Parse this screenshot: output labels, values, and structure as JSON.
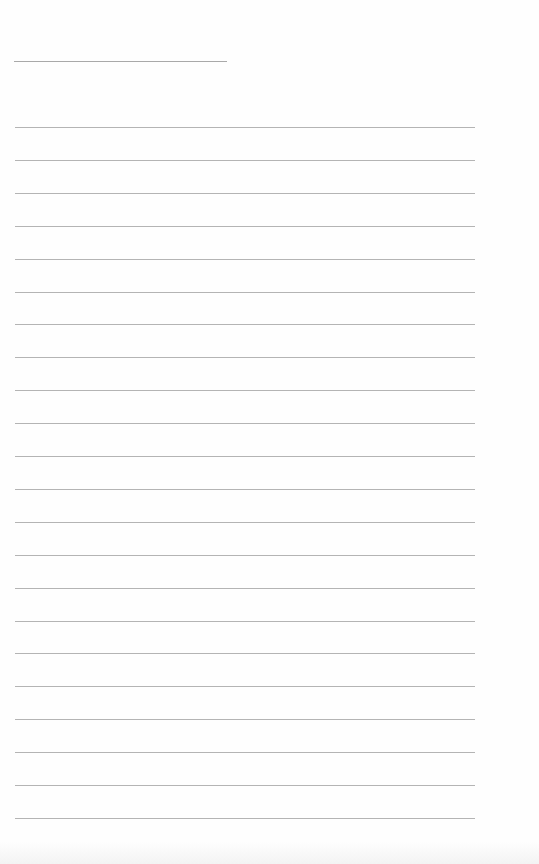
{
  "document": {
    "type": "blank lined paper",
    "title": "",
    "ruled_line_count": 22,
    "lines": [
      "",
      "",
      "",
      "",
      "",
      "",
      "",
      "",
      "",
      "",
      "",
      "",
      "",
      "",
      "",
      "",
      "",
      "",
      "",
      "",
      "",
      ""
    ],
    "colors": {
      "paper": "#fefefe",
      "rule": "#b4b4b4",
      "title_rule": "#a9a9a9"
    }
  }
}
